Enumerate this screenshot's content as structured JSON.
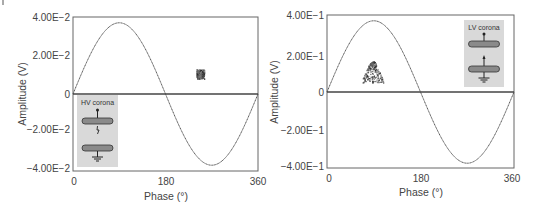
{
  "chart_data": [
    {
      "type": "line",
      "panel": "left",
      "title": "",
      "xlabel": "Phase (°)",
      "ylabel": "Amplitude (V)",
      "xlim": [
        0,
        360
      ],
      "ylim": [
        -0.04,
        0.04
      ],
      "x_ticks": [
        "0",
        "180",
        "360"
      ],
      "y_ticks": [
        "4.00E−2",
        "2.00E−2",
        "0",
        "−2.00E−2",
        "−4.00E−2"
      ],
      "grid": false,
      "series": [
        {
          "name": "AC reference sine",
          "x": [
            0,
            45,
            90,
            135,
            180,
            225,
            270,
            315,
            360
          ],
          "values": [
            0,
            0.026,
            0.037,
            0.026,
            0,
            -0.026,
            -0.037,
            -0.026,
            0
          ]
        },
        {
          "name": "PD pulses cluster",
          "type": "scatter",
          "x_range": [
            240,
            255
          ],
          "y_range": [
            0.008,
            0.013
          ]
        }
      ],
      "inset": {
        "label": "HV corona",
        "position": "lower-left"
      }
    },
    {
      "type": "line",
      "panel": "right",
      "title": "",
      "xlabel": "Phase (°)",
      "ylabel": "Amplitude (V)",
      "xlim": [
        0,
        360
      ],
      "ylim": [
        -0.4,
        0.4
      ],
      "x_ticks": [
        "0",
        "180",
        "360"
      ],
      "y_ticks": [
        "4.00E−1",
        "2.00E−1",
        "0",
        "−2.00E−1",
        "−4.00E−1"
      ],
      "grid": false,
      "series": [
        {
          "name": "AC reference sine",
          "x": [
            0,
            45,
            90,
            135,
            180,
            225,
            270,
            315,
            360
          ],
          "values": [
            0,
            0.26,
            0.37,
            0.26,
            0,
            -0.26,
            -0.37,
            -0.26,
            0
          ]
        },
        {
          "name": "PD pulses cluster",
          "type": "scatter",
          "x_range": [
            65,
            110
          ],
          "y_range": [
            0.05,
            0.16
          ]
        }
      ],
      "inset": {
        "label": "LV corona",
        "position": "upper-right"
      }
    }
  ],
  "panels": {
    "left": {
      "y_ticks": [
        "4.00E−2",
        "2.00E−2",
        "0",
        "−2.00E−2",
        "−4.00E−2"
      ],
      "x_ticks": [
        "0",
        "180",
        "360"
      ],
      "xlabel": "Phase (°)",
      "ylabel": "Amplitude (V)",
      "inset_label": "HV corona"
    },
    "right": {
      "y_ticks": [
        "4.00E−1",
        "2.00E−1",
        "0",
        "−2.00E−1",
        "−4.00E−1"
      ],
      "x_ticks": [
        "0",
        "180",
        "360"
      ],
      "xlabel": "Phase (°)",
      "ylabel": "Amplitude (V)",
      "inset_label": "LV corona"
    }
  },
  "colors": {
    "frame": "#555555",
    "sine": "#444444",
    "inset_bg": "#d9d9d9",
    "electrode": "#8a8a8a",
    "pd": "#3a3a3a"
  }
}
